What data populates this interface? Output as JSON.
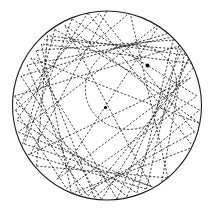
{
  "figure": {
    "background_color": "#ffffff",
    "stroke_color": "#1a1a1a",
    "canvas": {
      "width": 214,
      "height": 216
    }
  },
  "chart_data": {
    "type": "scatter",
    "subtitle": "",
    "xlabel": "",
    "ylabel": "",
    "xlim": [
      13,
      201
    ],
    "ylim": [
      8,
      203
    ],
    "grid": false,
    "legend_position": "none",
    "annotations": [],
    "tick_labels": {
      "x": [],
      "y": []
    },
    "boundary_circle": {
      "name": "outer-billiard-boundary",
      "cx": 107,
      "cy": 105.5,
      "r": 94.5,
      "style": "solid",
      "color": "#1a1a1a"
    },
    "caustic_ellipse": {
      "name": "inner-caustic-envelope",
      "cx": 131,
      "cy": 87,
      "rx": 46,
      "ry": 42,
      "rotation_deg": -18,
      "style": "dashed",
      "color": "#2b2b2b"
    },
    "foci": [
      {
        "label": "focus-upper-right",
        "x": 147.5,
        "y": 65.5,
        "r": 1.9
      },
      {
        "label": "focus-lower-left",
        "x": 105.5,
        "y": 107.5,
        "r": 1.6
      }
    ],
    "chord_style": {
      "dash": "2.2 1.7",
      "width": 0.85,
      "color": "#1c1c1c"
    },
    "chords": [
      [
        107.0,
        11.0,
        30.5,
        154.0
      ],
      [
        30.5,
        154.0,
        190.5,
        78.0
      ],
      [
        190.5,
        78.0,
        57.0,
        179.5
      ],
      [
        57.0,
        179.5,
        161.0,
        22.5
      ],
      [
        161.0,
        22.5,
        18.5,
        132.0
      ],
      [
        18.5,
        132.0,
        151.0,
        186.5
      ],
      [
        151.0,
        186.5,
        64.5,
        25.0
      ],
      [
        64.5,
        25.0,
        199.0,
        123.0
      ],
      [
        199.0,
        123.0,
        31.0,
        58.0
      ],
      [
        31.0,
        58.0,
        117.0,
        199.0
      ],
      [
        117.0,
        199.0,
        184.0,
        44.5
      ],
      [
        184.0,
        44.5,
        14.5,
        96.0
      ],
      [
        14.5,
        96.0,
        88.0,
        196.0
      ],
      [
        88.0,
        196.0,
        196.0,
        64.0
      ],
      [
        196.0,
        64.0,
        41.5,
        44.0
      ],
      [
        41.5,
        44.0,
        71.5,
        193.5
      ],
      [
        71.5,
        193.5,
        193.5,
        147.0
      ],
      [
        193.5,
        147.0,
        88.0,
        13.0
      ],
      [
        88.0,
        13.0,
        17.0,
        120.0
      ],
      [
        17.0,
        120.0,
        137.0,
        193.0
      ],
      [
        137.0,
        193.0,
        175.0,
        31.5
      ],
      [
        175.0,
        31.5,
        21.0,
        76.0
      ],
      [
        21.0,
        76.0,
        101.5,
        199.5
      ],
      [
        101.5,
        199.5,
        191.0,
        56.0
      ],
      [
        191.0,
        56.0,
        47.5,
        35.5
      ],
      [
        47.5,
        35.5,
        36.5,
        166.0
      ],
      [
        36.5,
        166.0,
        168.0,
        178.0
      ],
      [
        168.0,
        178.0,
        130.0,
        12.5
      ],
      [
        130.0,
        12.5,
        15.5,
        110.0
      ],
      [
        15.5,
        110.0,
        66.5,
        188.5
      ],
      [
        66.5,
        188.5,
        197.0,
        96.0
      ],
      [
        197.0,
        96.0,
        72.0,
        19.0
      ],
      [
        72.0,
        19.0,
        24.5,
        144.0
      ],
      [
        24.5,
        144.0,
        160.5,
        189.5
      ],
      [
        160.5,
        189.5,
        187.0,
        39.0
      ],
      [
        187.0,
        39.0,
        36.0,
        50.5
      ],
      [
        36.0,
        50.5,
        94.5,
        197.5
      ],
      [
        94.5,
        197.5,
        199.5,
        110.0
      ],
      [
        199.5,
        110.0,
        55.0,
        29.5
      ],
      [
        55.0,
        29.5,
        20.5,
        152.0
      ],
      [
        20.5,
        152.0,
        146.5,
        189.0
      ],
      [
        146.5,
        189.0,
        181.0,
        35.5
      ],
      [
        181.0,
        35.5,
        27.0,
        65.0
      ],
      [
        27.0,
        65.0,
        80.5,
        195.0
      ],
      [
        80.5,
        195.0,
        194.5,
        132.0
      ],
      [
        194.5,
        132.0,
        99.0,
        13.5
      ],
      [
        99.0,
        13.5,
        16.0,
        103.0
      ],
      [
        16.0,
        103.0,
        127.0,
        196.5
      ],
      [
        127.0,
        196.5,
        192.5,
        50.0
      ],
      [
        192.5,
        50.0,
        44.0,
        39.5
      ]
    ]
  }
}
